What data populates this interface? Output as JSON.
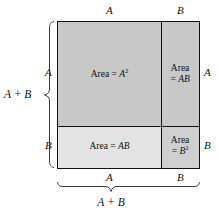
{
  "figure": {
    "top_labels": [
      {
        "text": "A",
        "name": "top-label-a"
      },
      {
        "text": "B",
        "name": "top-label-b"
      }
    ],
    "bottom_labels": [
      {
        "text": "A",
        "name": "bottom-label-a"
      },
      {
        "text": "B",
        "name": "bottom-label-b"
      }
    ],
    "left_labels": [
      {
        "text": "A",
        "name": "left-label-a"
      },
      {
        "text": "B",
        "name": "left-label-b"
      }
    ],
    "right_labels": [
      {
        "text": "A",
        "name": "right-label-a"
      },
      {
        "text": "B",
        "name": "right-label-b"
      }
    ],
    "left_brace_label": "A + B",
    "bottom_brace_label": "A + B",
    "cells": [
      {
        "name": "area-a-squared",
        "prefix": "Area = ",
        "base": "A",
        "exponent": "2",
        "fill": "#c8c8c8"
      },
      {
        "name": "area-ab-right",
        "line1": "Area",
        "line2_prefix": "= ",
        "line2_base": "AB",
        "fill": "#c8c8c8"
      },
      {
        "name": "area-ab-bottom",
        "prefix": "Area = ",
        "base": "AB",
        "exponent": "",
        "fill": "#e3e3e3"
      },
      {
        "name": "area-b-squared",
        "line1": "Area",
        "line2_prefix": "= ",
        "line2_base": "B",
        "line2_exponent": "2",
        "fill": "#cfcfcf"
      }
    ],
    "colors": {
      "stroke": "#111111",
      "brace": "#3a3a3a",
      "background": "#ffffff"
    }
  }
}
